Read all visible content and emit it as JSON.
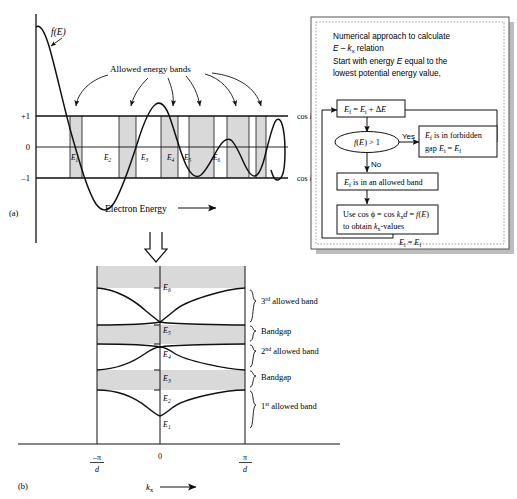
{
  "figure": {
    "panel_a_label": "(a)",
    "panel_b_label": "(b)"
  },
  "panel_a": {
    "fe_label": "f(E)",
    "allowed_bands_label": "Allowed energy bands",
    "xaxis_label": "Electron  Energy",
    "ytick_plus1": "+1",
    "ytick_zero": "0",
    "ytick_minus1": "–1",
    "cos_top_label": "cos kₓd = 1",
    "cos_bottom_label": "cos kₓd = –1",
    "energy_labels": [
      "E₁",
      "E₂",
      "E₃",
      "E₄",
      "E₅",
      "E₆"
    ]
  },
  "panel_b": {
    "energy_levels": [
      "E₆",
      "E₅",
      "E₄",
      "E₃",
      "E₂",
      "E₁"
    ],
    "band_annotations": [
      "3rd allowed band",
      "Bandgap",
      "2nd allowed band",
      "Bandgap",
      "1st allowed band"
    ],
    "band_annotation_sup": [
      "rd",
      "",
      "nd",
      "",
      "st"
    ],
    "band_annotation_num": [
      "3",
      "",
      "2",
      "",
      "1"
    ],
    "band_annotation_rest": [
      " allowed band",
      "Bandgap",
      " allowed band",
      "Bandgap",
      " allowed band"
    ],
    "xtick_left_num": "–π",
    "xtick_left_den": "d",
    "xtick_center": "0",
    "xtick_right_num": "π",
    "xtick_right_den": "d",
    "xaxis_label": "kₓ"
  },
  "flowchart": {
    "intro_line1": "Numerical approach to calculate",
    "intro_line2": "E – kₓ relation",
    "intro_line3": "Start with energy E equal to the",
    "intro_line4": "lowest potential energy value,",
    "box_increment": "Eғ = Eᵢ + ΔE",
    "box_increment_text": "Ef = Ei + ΔE",
    "decision": "f(E) > 1",
    "yes_label": "Yes",
    "no_label": "No",
    "box_forbidden_line1": "Eғ is in forbidden",
    "box_forbidden_line2": "gap Eᵢ = Eғ",
    "box_allowed": "Eғ is in an allowed band",
    "box_cos_line1": "Use cos ϕ = cos kₓd = f(E)",
    "box_cos_line2": "to obtain kₓ-values",
    "loop_label": "Eᵢ = Eғ"
  },
  "colors": {
    "band_shade": "#d9d9d9",
    "line": "#111111",
    "box_border": "#000000",
    "panel_border": "#555555",
    "panel_shadow": "#bdbdbd"
  }
}
